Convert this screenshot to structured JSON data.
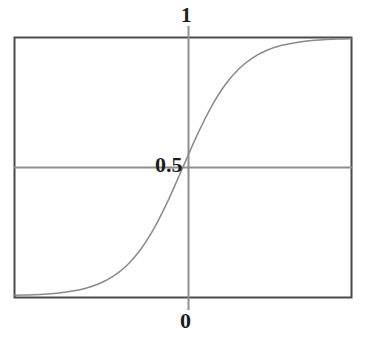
{
  "figure": {
    "background_color": "#ffffff",
    "frame_color": "#4b4b4b",
    "curve_color": "#8a8a8a",
    "axis_color": "#8f8f8f",
    "label_color": "#1c1c1c"
  },
  "labels": {
    "top": "1",
    "middle": "0.5",
    "bottom": "0"
  },
  "chart_data": {
    "type": "line",
    "title": "",
    "xlabel": "",
    "ylabel": "",
    "xlim": [
      -6,
      6
    ],
    "ylim": [
      0,
      1
    ],
    "grid": false,
    "legend": null,
    "axis_tick_labels": {
      "y": [
        "0",
        "0.5",
        "1"
      ],
      "y_values": [
        0,
        0.5,
        1
      ]
    },
    "annotations": [
      {
        "text": "1",
        "position": "top of vertical axis",
        "value": 1
      },
      {
        "text": "0.5",
        "position": "center, left of vertical axis",
        "value": 0.5
      },
      {
        "text": "0",
        "position": "bottom of vertical axis",
        "value": 0
      }
    ],
    "series": [
      {
        "name": "logistic",
        "x": [
          -6,
          -5.5,
          -5,
          -4.5,
          -4,
          -3.5,
          -3,
          -2.5,
          -2,
          -1.5,
          -1,
          -0.5,
          0,
          0.5,
          1,
          1.5,
          2,
          2.5,
          3,
          3.5,
          4,
          4.5,
          5,
          5.5,
          6
        ],
        "y": [
          0.0025,
          0.0041,
          0.0067,
          0.011,
          0.018,
          0.0293,
          0.0474,
          0.0759,
          0.1192,
          0.1824,
          0.2689,
          0.3775,
          0.5,
          0.6225,
          0.7311,
          0.8176,
          0.8808,
          0.9241,
          0.9526,
          0.9707,
          0.982,
          0.989,
          0.9933,
          0.9959,
          0.9975
        ]
      }
    ]
  }
}
